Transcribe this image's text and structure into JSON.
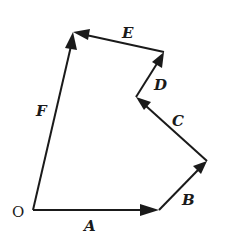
{
  "diagram": {
    "type": "vector-polygon",
    "origin_label": "O",
    "points": {
      "O": [
        33,
        210
      ],
      "P1": [
        159,
        210
      ],
      "P2": [
        207,
        161
      ],
      "P3": [
        136,
        97
      ],
      "P4": [
        164,
        52
      ],
      "P5": [
        73,
        32
      ]
    },
    "vectors": [
      {
        "label": "A",
        "from": "O",
        "to": "P1"
      },
      {
        "label": "B",
        "from": "P1",
        "to": "P2"
      },
      {
        "label": "C",
        "from": "P2",
        "to": "P3"
      },
      {
        "label": "D",
        "from": "P3",
        "to": "P4"
      },
      {
        "label": "E",
        "from": "P4",
        "to": "P5"
      },
      {
        "label": "F",
        "from": "O",
        "to": "P5"
      }
    ],
    "color": "#1a1a1a"
  }
}
